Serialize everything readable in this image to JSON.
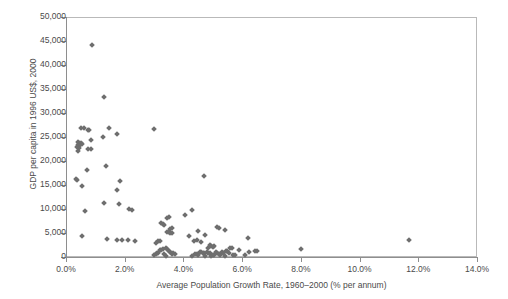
{
  "chart_data": {
    "type": "scatter",
    "title": "",
    "xlabel": "Average Population Growth Rate, 1960–2000 (% per annum)",
    "ylabel": "GDP per capita in 1996 US$, 2000",
    "xlim": [
      0,
      14
    ],
    "ylim": [
      0,
      50000
    ],
    "xticks": [
      0,
      2,
      4,
      6,
      8,
      10,
      12,
      14
    ],
    "xtick_labels": [
      "0.0%",
      "2.0%",
      "4.0%",
      "6.0%",
      "8.0%",
      "10.0%",
      "12.0%",
      "14.0%"
    ],
    "yticks": [
      0,
      5000,
      10000,
      15000,
      20000,
      25000,
      30000,
      35000,
      40000,
      45000,
      50000
    ],
    "ytick_labels": [
      "0",
      "5,000",
      "10,000",
      "15,000",
      "20,000",
      "25,000",
      "30,000",
      "35,000",
      "40,000",
      "45,000",
      "50,000"
    ],
    "grid": false,
    "legend": false,
    "marker": {
      "shape": "diamond",
      "color": "#6e6e6e",
      "size": 4
    },
    "axis_color": "#8e8e8e",
    "background": "#ffffff",
    "series": [
      {
        "name": "Countries",
        "points": [
          [
            0.9,
            44200
          ],
          [
            1.3,
            33300
          ],
          [
            0.5,
            26800
          ],
          [
            0.6,
            26900
          ],
          [
            0.75,
            26500
          ],
          [
            0.8,
            26400
          ],
          [
            1.45,
            26800
          ],
          [
            1.75,
            25600
          ],
          [
            3.0,
            26700
          ],
          [
            1.25,
            24900
          ],
          [
            0.85,
            24400
          ],
          [
            0.4,
            23900
          ],
          [
            0.45,
            23800
          ],
          [
            0.5,
            23700
          ],
          [
            0.55,
            23600
          ],
          [
            0.42,
            23400
          ],
          [
            0.48,
            23300
          ],
          [
            0.38,
            22900
          ],
          [
            0.44,
            22800
          ],
          [
            0.4,
            22100
          ],
          [
            0.75,
            22400
          ],
          [
            0.85,
            22500
          ],
          [
            1.35,
            18900
          ],
          [
            0.7,
            18200
          ],
          [
            4.7,
            16800
          ],
          [
            0.35,
            16300
          ],
          [
            0.38,
            16100
          ],
          [
            1.85,
            15900
          ],
          [
            0.55,
            14800
          ],
          [
            1.75,
            14000
          ],
          [
            1.3,
            11200
          ],
          [
            1.8,
            11000
          ],
          [
            2.15,
            9900
          ],
          [
            2.25,
            9800
          ],
          [
            4.3,
            9800
          ],
          [
            0.65,
            9600
          ],
          [
            4.05,
            8700
          ],
          [
            3.5,
            8400
          ],
          [
            3.45,
            8200
          ],
          [
            3.25,
            7100
          ],
          [
            3.3,
            6900
          ],
          [
            3.35,
            6700
          ],
          [
            5.15,
            6300
          ],
          [
            5.2,
            6100
          ],
          [
            3.6,
            6000
          ],
          [
            3.55,
            5800
          ],
          [
            5.4,
            5700
          ],
          [
            4.5,
            5500
          ],
          [
            3.5,
            5300
          ],
          [
            3.45,
            5200
          ],
          [
            3.55,
            5000
          ],
          [
            3.6,
            4900
          ],
          [
            4.75,
            4500
          ],
          [
            4.2,
            4400
          ],
          [
            0.55,
            4300
          ],
          [
            11.7,
            3500
          ],
          [
            1.4,
            3700
          ],
          [
            1.75,
            3500
          ],
          [
            1.9,
            3500
          ],
          [
            2.1,
            3500
          ],
          [
            2.35,
            3400
          ],
          [
            6.2,
            3900
          ],
          [
            4.45,
            3600
          ],
          [
            4.35,
            3400
          ],
          [
            3.2,
            3400
          ],
          [
            3.15,
            3300
          ],
          [
            4.6,
            3200
          ],
          [
            3.05,
            2900
          ],
          [
            4.9,
            2400
          ],
          [
            4.95,
            2300
          ],
          [
            5.05,
            2200
          ],
          [
            5.0,
            2000
          ],
          [
            4.85,
            1900
          ],
          [
            5.6,
            1900
          ],
          [
            5.65,
            1800
          ],
          [
            3.4,
            1800
          ],
          [
            3.45,
            1700
          ],
          [
            3.3,
            1600
          ],
          [
            8.0,
            1600
          ],
          [
            3.2,
            1500
          ],
          [
            3.25,
            1400
          ],
          [
            5.9,
            1500
          ],
          [
            6.45,
            1300
          ],
          [
            6.5,
            1200
          ],
          [
            6.25,
            1100
          ],
          [
            3.5,
            1200
          ],
          [
            3.55,
            1100
          ],
          [
            4.55,
            1100
          ],
          [
            4.6,
            1000
          ],
          [
            4.65,
            900
          ],
          [
            4.7,
            800
          ],
          [
            4.8,
            1000
          ],
          [
            4.85,
            900
          ],
          [
            4.9,
            800
          ],
          [
            5.1,
            1000
          ],
          [
            5.15,
            900
          ],
          [
            5.3,
            1000
          ],
          [
            5.35,
            900
          ],
          [
            5.45,
            1300
          ],
          [
            5.5,
            1200
          ],
          [
            5.55,
            800
          ],
          [
            3.1,
            900
          ],
          [
            3.15,
            800
          ],
          [
            3.35,
            700
          ],
          [
            3.6,
            600
          ],
          [
            3.65,
            900
          ],
          [
            3.7,
            700
          ],
          [
            3.05,
            600
          ],
          [
            4.4,
            700
          ],
          [
            4.45,
            600
          ],
          [
            4.5,
            500
          ],
          [
            5.0,
            500
          ],
          [
            5.05,
            400
          ],
          [
            5.2,
            600
          ],
          [
            5.25,
            500
          ],
          [
            5.7,
            500
          ],
          [
            5.75,
            400
          ],
          [
            6.1,
            400
          ],
          [
            3.0,
            400
          ],
          [
            3.4,
            300
          ],
          [
            4.3,
            300
          ],
          [
            4.75,
            300
          ],
          [
            4.95,
            200
          ],
          [
            5.4,
            200
          ]
        ]
      }
    ]
  }
}
